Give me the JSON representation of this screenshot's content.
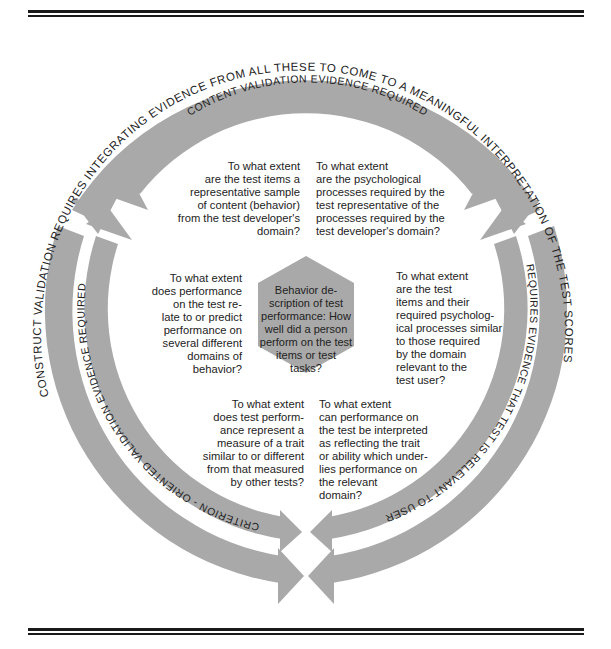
{
  "diagram": {
    "outer_ring": {
      "text_top": "CONSTRUCT VALIDATION REQUIRES INTEGRATING EVIDENCE FROM ALL THESE TO COME TO A MEANINGFUL INTERPRETATION OF THE TEST SCORES"
    },
    "inner_ring": {
      "top_text": "CONTENT VALIDATION EVIDENCE REQUIRED",
      "right_text": "REQUIRES EVIDENCE THAT TEST IS RELEVANT TO USER",
      "left_text": "CRITERION - ORIENTED VALIDATION EVIDENCE REQUIRED"
    },
    "center": {
      "text": "Behavior de-\nscription of test\nperformance: How\nwell did a person\nperform on the test\nitems or test\ntasks?"
    },
    "questions": {
      "top_left": "To what extent\nare the test items a\nrepresentative sample\nof content (behavior)\nfrom the test developer's\ndomain?",
      "top_right": "To what extent\nare the psychological\nprocesses required by the\ntest representative of the\nprocesses required by the\ntest developer's domain?",
      "mid_left": "To what extent\ndoes performance\non the test re-\nlate to or predict\nperformance on\nseveral different\ndomains of\nbehavior?",
      "mid_right": "To what extent\nare the test\nitems and their\nrequired psycholog-\nical processes similar\nto those required\nby the domain\nrelevant to the\ntest user?",
      "bottom_left": "To what extent\ndoes test perform-\nance represent a\nmeasure of a trait\nsimilar to or different\nfrom that measured\nby other tests?",
      "bottom_right": "To what extent\ncan performance on\nthe test be interpreted\nas reflecting the trait\nor ability which under-\nlies performance on\nthe relevant\ndomain?"
    },
    "colors": {
      "band": "#a9a9a9",
      "hexagon": "#a9a9a9",
      "text": "#222222",
      "rules": "#1a1a1a"
    }
  }
}
